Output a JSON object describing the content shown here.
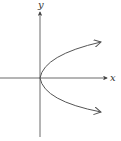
{
  "diagram": {
    "title": "",
    "axes": {
      "x_label": "x",
      "y_label": "y"
    },
    "curve": {
      "type": "parabola",
      "equation": "x = y^2",
      "vertex": [
        0,
        0
      ],
      "opens": "right",
      "arrows": [
        "upper-right",
        "lower-right"
      ]
    },
    "colors": {
      "axis": "#444444",
      "curve": "#555555"
    }
  }
}
